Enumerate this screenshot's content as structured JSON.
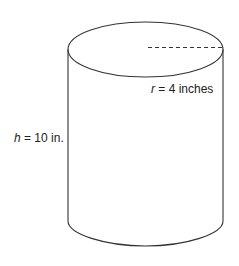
{
  "diagram": {
    "shape": "cylinder",
    "radius_label": {
      "var": "r",
      "text": " = 4 inches"
    },
    "height_label": {
      "var": "h",
      "text": " = 10 in."
    },
    "stroke_color": "#333333"
  }
}
